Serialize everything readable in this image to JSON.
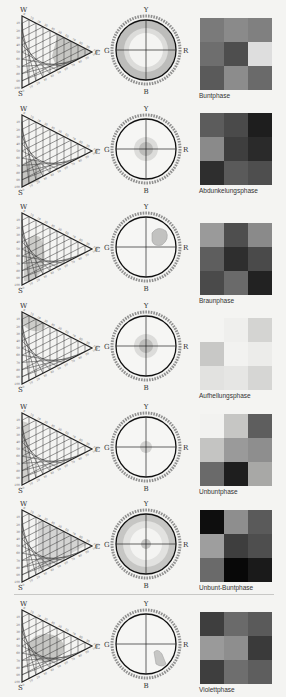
{
  "triangle_labels": {
    "top": "W",
    "right": "C",
    "bottom": "S"
  },
  "circle_labels": {
    "top": "Y",
    "left": "G",
    "right": "R",
    "bottom": "B"
  },
  "phases": [
    {
      "name": "Buntphase",
      "tri_region": "right",
      "circle_mode": "ring",
      "swatches": [
        "#7a7a7a",
        "#8a8a8a",
        "#808080",
        "#6e6e6e",
        "#4e4e4e",
        "#dedede",
        "#5a5a5a",
        "#8c8c8c",
        "#6a6a6a"
      ]
    },
    {
      "name": "Abdunkelungsphase",
      "tri_region": "bottom-left",
      "circle_mode": "center",
      "swatches": [
        "#5c5c5c",
        "#4a4a4a",
        "#1e1e1e",
        "#8a8a8a",
        "#3e3e3e",
        "#2a2a2a",
        "#2e2e2e",
        "#5a5a5a",
        "#4e4e4e"
      ]
    },
    {
      "name": "Braunphase",
      "tri_region": "left-center",
      "circle_mode": "blob-upper-right",
      "swatches": [
        "#9a9a9a",
        "#4e4e4e",
        "#8a8a8a",
        "#5e5e5e",
        "#2e2e2e",
        "#4a4a4a",
        "#4a4a4a",
        "#6a6a6a",
        "#222222"
      ]
    },
    {
      "name": "Aufhellungsphase",
      "tri_region": "top",
      "circle_mode": "center",
      "swatches": [
        "#f4f4f2",
        "#efefed",
        "#d4d4d2",
        "#c8c8c6",
        "#f2f2f0",
        "#ececea",
        "#e2e2e0",
        "#e6e6e4",
        "#d6d6d4"
      ]
    },
    {
      "name": "Unbuntphase",
      "tri_region": "left-edge",
      "circle_mode": "center-small",
      "swatches": [
        "#f2f2f0",
        "#c6c6c4",
        "#5e5e5e",
        "#c4c4c2",
        "#9a9a9a",
        "#8e8e8e",
        "#6a6a6a",
        "#1e1e1e",
        "#a8a8a6"
      ]
    },
    {
      "name": "Unbunt-Buntphase",
      "tri_region": "full",
      "circle_mode": "ring-full",
      "swatches": [
        "#0e0e0e",
        "#8e8e8e",
        "#5a5a5a",
        "#9e9e9e",
        "#3e3e3e",
        "#4e4e4e",
        "#6a6a6a",
        "#080808",
        "#1a1a1a"
      ]
    },
    {
      "name": "Violettphase",
      "tri_region": "center",
      "circle_mode": "blob-lower-right",
      "swatches": [
        "#3e3e3e",
        "#6a6a6a",
        "#5a5a5a",
        "#9a9a9a",
        "#8e8e8e",
        "#3a3a3a",
        "#3e3e3e",
        "#6e6e6e",
        "#5e5e5e"
      ]
    }
  ],
  "tick_values": [
    "100",
    "90",
    "80",
    "70",
    "60",
    "50",
    "40",
    "30",
    "20",
    "10",
    "0"
  ]
}
